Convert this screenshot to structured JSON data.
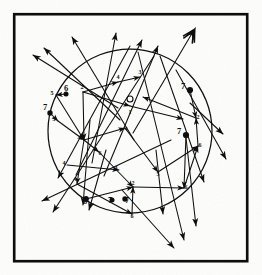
{
  "figure": {
    "kind": "hand-drawn scanned diagram",
    "frame": {
      "x": 13,
      "y": 13,
      "width": 235,
      "height": 249
    },
    "circle": {
      "cx": 130,
      "cy": 131,
      "r": 82
    },
    "ink_color": "#0d0d0d",
    "paper_color": "#fdfdfb"
  },
  "nodes": [
    {
      "id": "n1",
      "label": "1",
      "x": 130,
      "y": 106,
      "style": "open",
      "label_dx": 0,
      "label_dy": 8
    },
    {
      "id": "n2",
      "label": "2",
      "x": 83,
      "y": 92,
      "style": "plain",
      "label_dx": -1,
      "label_dy": -3
    },
    {
      "id": "n3",
      "label": "3",
      "x": 140,
      "y": 77,
      "style": "plain",
      "label_dx": 0,
      "label_dy": -3
    },
    {
      "id": "n4",
      "label": "4",
      "x": 118,
      "y": 82,
      "style": "plain",
      "label_dx": 0,
      "label_dy": -3
    },
    {
      "id": "n5",
      "label": "5",
      "x": 56,
      "y": 95,
      "style": "plain",
      "label_dx": -4,
      "label_dy": 0
    },
    {
      "id": "n6",
      "label": "6",
      "x": 66,
      "y": 94,
      "style": "dot",
      "label_dx": 0,
      "label_dy": -3
    },
    {
      "id": "n7",
      "label": "7",
      "x": 190,
      "y": 90,
      "style": "dot",
      "label_dx": -7,
      "label_dy": -1
    },
    {
      "id": "n8",
      "label": "7",
      "x": 186,
      "y": 135,
      "style": "dot",
      "label_dx": -7,
      "label_dy": -1
    },
    {
      "id": "n9",
      "label": "2",
      "x": 196,
      "y": 118,
      "style": "plain",
      "label_dx": 2,
      "label_dy": 1
    },
    {
      "id": "n10",
      "label": "6",
      "x": 198,
      "y": 146,
      "style": "plain",
      "label_dx": 2,
      "label_dy": 1
    },
    {
      "id": "n11",
      "label": "6",
      "x": 184,
      "y": 188,
      "style": "plain",
      "label_dx": 2,
      "label_dy": 1
    },
    {
      "id": "n12",
      "label": "5",
      "x": 158,
      "y": 172,
      "style": "plain",
      "label_dx": 0,
      "label_dy": 4
    },
    {
      "id": "n13",
      "label": "2",
      "x": 133,
      "y": 187,
      "style": "plain",
      "label_dx": 0,
      "label_dy": -2
    },
    {
      "id": "n14",
      "label": "6",
      "x": 132,
      "y": 214,
      "style": "plain",
      "label_dx": 0,
      "label_dy": 4
    },
    {
      "id": "n15",
      "label": "4",
      "x": 119,
      "y": 170,
      "style": "plain",
      "label_dx": -3,
      "label_dy": 0
    },
    {
      "id": "n16",
      "label": "3",
      "x": 84,
      "y": 140,
      "style": "plain",
      "label_dx": -3,
      "label_dy": 0
    },
    {
      "id": "n17",
      "label": "4",
      "x": 77,
      "y": 184,
      "style": "plain",
      "label_dx": -2,
      "label_dy": -3
    },
    {
      "id": "n18",
      "label": "5",
      "x": 58,
      "y": 121,
      "style": "plain",
      "label_dx": -4,
      "label_dy": 0
    },
    {
      "id": "n19",
      "label": "7",
      "x": 50,
      "y": 113,
      "style": "dot",
      "label_dx": -5,
      "label_dy": -3
    },
    {
      "id": "n20",
      "label": "8",
      "x": 86,
      "y": 199,
      "style": "dot",
      "label_dx": -1,
      "label_dy": 5
    },
    {
      "id": "n21",
      "label": "7",
      "x": 125,
      "y": 199,
      "style": "dot",
      "label_dx": 2,
      "label_dy": 4
    },
    {
      "id": "n22",
      "label": "7",
      "x": 112,
      "y": 200,
      "style": "dot",
      "label_dx": -2,
      "label_dy": 3
    },
    {
      "id": "n23",
      "label": "4",
      "x": 125,
      "y": 128,
      "style": "plain",
      "label_dx": 1,
      "label_dy": 3
    },
    {
      "id": "n24",
      "label": "6",
      "x": 99,
      "y": 152,
      "style": "plain",
      "label_dx": 1,
      "label_dy": 3
    },
    {
      "id": "n25",
      "label": "4",
      "x": 67,
      "y": 165,
      "style": "plain",
      "label_dx": -3,
      "label_dy": 0
    }
  ],
  "fletched_arrow": {
    "from": {
      "x": 133,
      "y": 133
    },
    "to": {
      "x": 198,
      "y": 25
    },
    "note": "long shaft crossing diagram ending in a feathered arrow nock at top right"
  },
  "counts": {
    "nodes": 25,
    "ring": 1,
    "frame": 1
  }
}
